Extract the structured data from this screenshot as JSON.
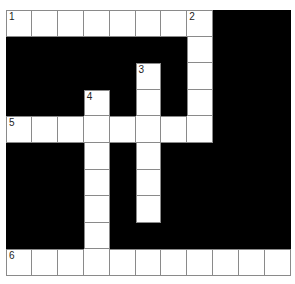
{
  "puzzle": {
    "type": "crossword",
    "columns": 11,
    "rows": 10,
    "colors": {
      "fill": "#000000",
      "cell": "#ffffff",
      "line": "#8a8a8a",
      "number": "#222222"
    },
    "clue_numbers": [
      {
        "number": "1",
        "row": 0,
        "col": 0
      },
      {
        "number": "2",
        "row": 0,
        "col": 7
      },
      {
        "number": "3",
        "row": 2,
        "col": 5
      },
      {
        "number": "4",
        "row": 3,
        "col": 3
      },
      {
        "number": "5",
        "row": 4,
        "col": 0
      },
      {
        "number": "6",
        "row": 9,
        "col": 0
      }
    ],
    "entries": [
      {
        "number": "1",
        "direction": "across",
        "row": 0,
        "col": 0,
        "length": 8
      },
      {
        "number": "2",
        "direction": "down",
        "row": 0,
        "col": 7,
        "length": 5
      },
      {
        "number": "3",
        "direction": "down",
        "row": 2,
        "col": 5,
        "length": 6
      },
      {
        "number": "4",
        "direction": "down",
        "row": 3,
        "col": 3,
        "length": 7
      },
      {
        "number": "5",
        "direction": "across",
        "row": 4,
        "col": 0,
        "length": 8
      },
      {
        "number": "6",
        "direction": "across",
        "row": 9,
        "col": 0,
        "length": 11
      }
    ],
    "layout": [
      "WWWWWWWWBBB",
      "BBBBBBBWBBB",
      "BBBBBWBWBBB",
      "BBBWBWBWBBB",
      "WWWWWWWWBBB",
      "BBBWBWBBBBB",
      "BBBWBWBBBBB",
      "BBBWBWBBBBB",
      "BBBWBBBBBBB",
      "WWWWWWWWWWW"
    ]
  }
}
